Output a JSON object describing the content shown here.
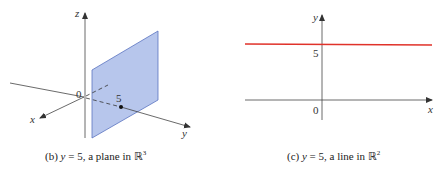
{
  "left_figure": {
    "axes": {
      "x": "x",
      "y": "y",
      "z": "z"
    },
    "origin_label": "0",
    "point_label": "5",
    "colors": {
      "plane_fill": "#b7c6ec",
      "plane_edge": "#5a73c0",
      "axis": "#444444"
    },
    "caption": {
      "prefix": "(b) ",
      "var": "y",
      "rest": " = 5, a plane in ",
      "set": "ℝ",
      "sup": "3"
    }
  },
  "right_figure": {
    "axes": {
      "x": "x",
      "y": "y"
    },
    "origin_label": "0",
    "tick_label": "5",
    "colors": {
      "line": "#e0322a",
      "axis": "#444444"
    },
    "caption": {
      "prefix": "(c) ",
      "var": "y",
      "rest": " = 5, a line in ",
      "set": "ℝ",
      "sup": "2"
    }
  }
}
